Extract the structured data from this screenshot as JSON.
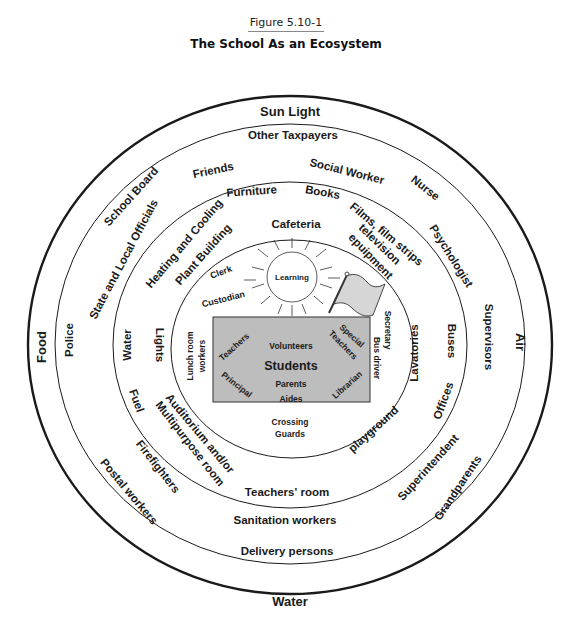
{
  "figure": {
    "label": "Figure 5.10-1",
    "title": "The School As an Ecosystem"
  },
  "rings": {
    "outer": {
      "name": "Natural environment",
      "items": [
        "Sun Light",
        "Air",
        "Water",
        "Food"
      ]
    },
    "ring2": {
      "name": "Community",
      "items": [
        "Other Taxpayers",
        "Social Worker",
        "Nurse",
        "Psychologist",
        "Supervisors",
        "Grandparents",
        "Superintendent",
        "Delivery persons",
        "Sanitation workers",
        "Postal workers",
        "Firefighters",
        "Police",
        "State and Local Officials",
        "School Board",
        "Friends"
      ]
    },
    "ring3": {
      "name": "Physical plant",
      "items": [
        "Furniture",
        "Books",
        "Films, film strips",
        "television",
        "epuipment",
        "Buses",
        "Offices",
        "Teachers' room",
        "Fuel",
        "Water",
        "Heating and Cooling",
        "Plant Building",
        "Lights",
        "Lavatories",
        "Auditorium and/or",
        "Multipurpose room",
        "Cafeteria",
        "playground"
      ]
    },
    "ring4": {
      "name": "Support staff",
      "items": [
        "Clerk",
        "Custodian",
        "Lunch room",
        "workers",
        "Secretary",
        "Bus driver",
        "Crossing",
        "Guards",
        "Learning"
      ]
    },
    "core": {
      "name": "Core",
      "center": "Students",
      "items": [
        "Teachers",
        "Volunteers",
        "Special",
        "Teachers",
        "Principal",
        "Parents",
        "Aides",
        "Librarian"
      ]
    }
  },
  "labels": {
    "sun_light": "Sun Light",
    "air": "Air",
    "water_outer": "Water",
    "food": "Food",
    "other_taxpayers": "Other Taxpayers",
    "social_worker": "Social Worker",
    "nurse": "Nurse",
    "psychologist": "Psychologist",
    "supervisors": "Supervisors",
    "grandparents": "Grandparents",
    "superintendent": "Superintendent",
    "delivery_persons": "Delivery persons",
    "sanitation_workers": "Sanitation workers",
    "postal_workers": "Postal workers",
    "firefighters": "Firefighters",
    "police": "Police",
    "state_local": "State and Local Officials",
    "school_board": "School Board",
    "friends": "Friends",
    "furniture": "Furniture",
    "books": "Books",
    "films1": "Films, film strips",
    "films2": "television",
    "films3": "epuipment",
    "buses": "Buses",
    "offices": "Offices",
    "teachers_room": "Teachers' room",
    "fuel": "Fuel",
    "water_inner": "Water",
    "heating1": "Heating and Cooling",
    "heating2": "Plant Building",
    "lights": "Lights",
    "lavatories": "Lavatories",
    "auditorium1": "Auditorium and/or",
    "auditorium2": "Multipurpose room",
    "cafeteria": "Cafeteria",
    "playground": "playground",
    "clerk": "Clerk",
    "custodian": "Custodian",
    "lunch1": "Lunch room",
    "lunch2": "workers",
    "secretary": "Secretary",
    "bus_driver": "Bus driver",
    "crossing1": "Crossing",
    "crossing2": "Guards",
    "learning": "Learning",
    "teachers": "Teachers",
    "volunteers": "Volunteers",
    "special1": "Special",
    "special2": "Teachers",
    "students": "Students",
    "principal": "Principal",
    "parents": "Parents",
    "aides": "Aides",
    "librarian": "Librarian"
  },
  "colors": {
    "stroke": "#1a1a1a",
    "core_fill": "#bdbdbd",
    "flag_fill": "#d6d6d6"
  }
}
